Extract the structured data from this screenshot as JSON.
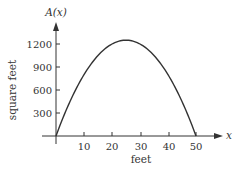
{
  "chart_data": {
    "type": "line",
    "title": "",
    "function_label": "A(x)",
    "xlabel": "feet",
    "ylabel": "square feet",
    "x_axis_symbol": "x",
    "xlim": [
      0,
      55
    ],
    "ylim": [
      0,
      1350
    ],
    "x_ticks": [
      10,
      20,
      30,
      40,
      50
    ],
    "y_ticks": [
      300,
      600,
      900,
      1200
    ],
    "grid": false,
    "legend": null,
    "series": [
      {
        "name": "A(x) = x(50 - x)",
        "x": [
          0,
          5,
          10,
          15,
          20,
          25,
          30,
          35,
          40,
          45,
          50
        ],
        "y": [
          0,
          225,
          400,
          525,
          600,
          625,
          600,
          525,
          400,
          225,
          0
        ]
      }
    ],
    "annotations": [],
    "color": "#333333"
  },
  "labels": {
    "function": "A(x)",
    "y_axis": "square feet",
    "x_axis": "feet",
    "x_symbol": "x",
    "x_ticks": [
      "10",
      "20",
      "30",
      "40",
      "50"
    ],
    "y_ticks": [
      "1200",
      "900",
      "600",
      "300"
    ]
  }
}
